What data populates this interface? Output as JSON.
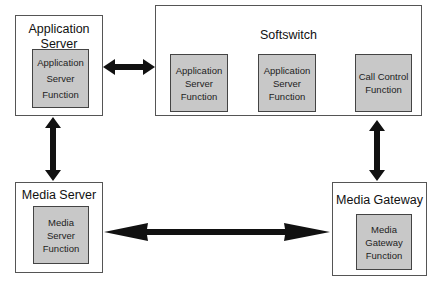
{
  "diagram": {
    "nodes": {
      "app_server": {
        "title": "Application Server",
        "inner": [
          "Application",
          "Server",
          "Function"
        ]
      },
      "softswitch": {
        "title": "Softswitch",
        "functions": [
          {
            "lines": [
              "Application",
              "Server",
              "Function"
            ]
          },
          {
            "lines": [
              "Application",
              "Server",
              "Function"
            ]
          },
          {
            "lines": [
              "Call Control",
              "Function"
            ]
          }
        ]
      },
      "media_server": {
        "title": "Media Server",
        "inner": [
          "Media",
          "Server",
          "Function"
        ]
      },
      "media_gateway": {
        "title": "Media Gateway",
        "inner": [
          "Media",
          "Gateway",
          "Function"
        ]
      }
    },
    "edges": [
      {
        "from": "Application Server",
        "to": "Softswitch",
        "type": "bidirectional"
      },
      {
        "from": "Application Server",
        "to": "Media Server",
        "type": "bidirectional"
      },
      {
        "from": "Softswitch",
        "to": "Media Gateway",
        "type": "bidirectional"
      },
      {
        "from": "Media Server",
        "to": "Media Gateway",
        "type": "bidirectional"
      }
    ],
    "colors": {
      "inner_fill": "#c8c8c8",
      "arrow": "#111111",
      "border": "#555555"
    }
  }
}
